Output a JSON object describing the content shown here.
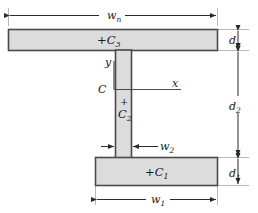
{
  "diagram": {
    "shapes": {
      "top_flange": {
        "label": "+C",
        "sub": "3",
        "name": "top-flange"
      },
      "web": {
        "label_plus": "+",
        "label": "C",
        "sub": "2",
        "name": "web"
      },
      "bottom_flange": {
        "label": "+C",
        "sub": "1",
        "name": "bottom-flange"
      }
    },
    "axes": {
      "origin_label": "C",
      "y_label": "y",
      "x_label": "x"
    },
    "dimensions": {
      "width_top": {
        "label": "w",
        "sub": "n"
      },
      "width_web": {
        "label": "w",
        "sub": "2"
      },
      "width_bottom": {
        "label": "w",
        "sub": "1"
      },
      "depth_top": {
        "label": "d",
        "sub": "n"
      },
      "depth_web": {
        "label": "d",
        "sub": "2"
      },
      "depth_bottom": {
        "label": "d",
        "sub": "1"
      }
    },
    "colors": {
      "fill": "#dcdcdc",
      "stroke": "#4a4a4a",
      "line": "#2b2b2b",
      "thin": "#8a8a8a"
    }
  }
}
